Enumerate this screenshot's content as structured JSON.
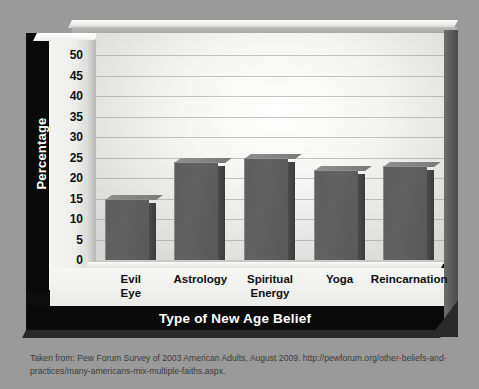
{
  "figure": {
    "caption": "Taken from: Pew Forum Survey of 2003 American Adults, August 2009. http://pewforum.org/other-beliefs-and-practices/many-americans-mix-multiple-faiths.aspx.",
    "background_color": "#9a9a9a",
    "panel_color": "#0d0d0d",
    "bar_color": "#5d5d5d"
  },
  "chart_data": {
    "type": "bar",
    "title": "",
    "xlabel": "Type of New Age Belief",
    "ylabel": "Percentage",
    "categories": [
      "Evil Eye",
      "Astrology",
      "Spiritual Energy",
      "Yoga",
      "Reincarnation"
    ],
    "category_lines": [
      [
        "Evil",
        "Eye"
      ],
      [
        "Astrology"
      ],
      [
        "Spiritual",
        "Energy"
      ],
      [
        "Yoga"
      ],
      [
        "Reincarnation"
      ]
    ],
    "values": [
      15,
      24,
      25,
      22,
      23
    ],
    "ylim": [
      0,
      50
    ],
    "yticks": [
      0,
      5,
      10,
      15,
      20,
      25,
      30,
      35,
      40,
      45,
      50
    ],
    "ytick_labels": [
      "0",
      "5",
      "10",
      "15",
      "20",
      "25",
      "30",
      "35",
      "40",
      "45",
      "50"
    ],
    "grid": true,
    "legend": null,
    "style": "3d-bar"
  }
}
